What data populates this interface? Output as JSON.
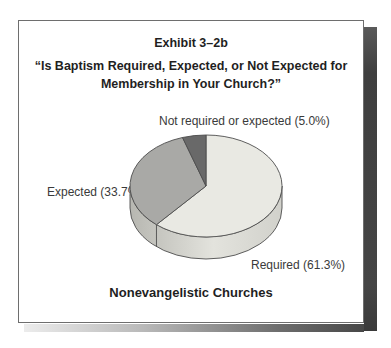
{
  "exhibit": {
    "title": "Exhibit 3–2b",
    "question_line1": "“Is Baptism Required, Expected, or Not Expected for",
    "question_line2": "Membership in Your Church?”",
    "caption": "Nonevangelistic Churches"
  },
  "chart_data": {
    "type": "pie",
    "style": "3d",
    "title": "“Is Baptism Required, Expected, or Not Expected for Membership in Your Church?”",
    "subtitle": "Nonevangelistic Churches",
    "start_angle_deg": 0,
    "direction": "clockwise",
    "slices": [
      {
        "label": "Required",
        "value": 61.3,
        "display": "Required (61.3%)",
        "color": "#e9e9e3"
      },
      {
        "label": "Expected",
        "value": 33.7,
        "display": "Expected (33.7%)",
        "color": "#a9a9a6"
      },
      {
        "label": "Not required or expected",
        "value": 5.0,
        "display": "Not required or expected (5.0%)",
        "color": "#696969"
      }
    ],
    "legend": "none",
    "outline_color": "#4d4d4d",
    "rim_colors": {
      "left": "#b7b7b1",
      "middle": "#e3e3dd",
      "right": "#d1d1cb"
    }
  },
  "frame": {
    "card_background": "#ffffff",
    "card_border_color": "#6e6e6e",
    "shadow_color": "#454545"
  }
}
